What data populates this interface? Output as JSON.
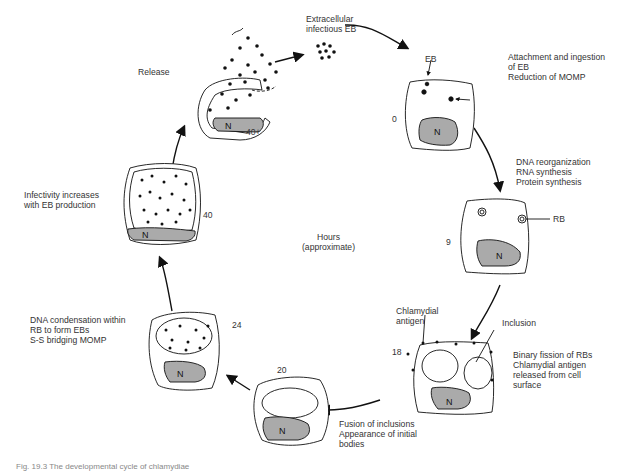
{
  "diagram": {
    "type": "cycle",
    "center_label": "Hours\n(approximate)",
    "stages": [
      {
        "id": "extracellular",
        "time": "",
        "label": "Extracellular\ninfectious EB"
      },
      {
        "id": "0",
        "time": "0",
        "label": "Attachment and ingestion\nof EB\nReduction of MOMP",
        "callouts": [
          "EB"
        ]
      },
      {
        "id": "9",
        "time": "9",
        "label": "DNA reorganization\nRNA synthesis\nProtein synthesis",
        "callouts": [
          "RB"
        ]
      },
      {
        "id": "18",
        "time": "18",
        "label": "Binary fission of RBs\nChlamydial antigen\nreleased from cell\nsurface",
        "callouts": [
          "Chlamydial\nantigen",
          "Inclusion"
        ]
      },
      {
        "id": "20",
        "time": "20",
        "label": "Fusion of inclusions\nAppearance of initial\nbodies"
      },
      {
        "id": "24",
        "time": "24",
        "label": "DNA condensation within\nRB to form EBs\nS-S bridging MOMP"
      },
      {
        "id": "40",
        "time": "40",
        "label": "Infectivity increases\nwith EB production"
      },
      {
        "id": "40plus",
        "time": "40+",
        "label": "Release"
      }
    ],
    "nucleus_label": "N"
  },
  "caption": "Fig. 19.3  The developmental cycle of chlamydiae"
}
